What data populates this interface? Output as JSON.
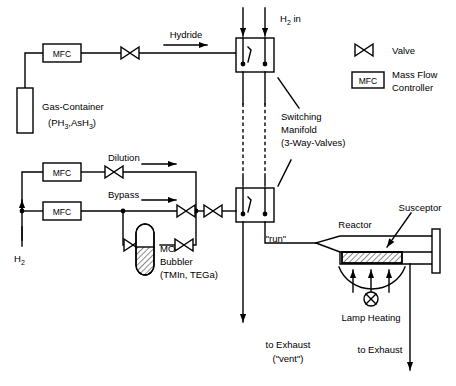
{
  "diagram": {
    "type": "process-flow-diagram",
    "stroke_color": "#000000",
    "background_color": "#ffffff"
  },
  "legend": {
    "items": [
      {
        "icon": "valve-icon",
        "label": "Valve"
      },
      {
        "icon": "mfc-box-icon",
        "box_text": "MFC",
        "label_line1": "Mass Flow",
        "label_line2": "Controller"
      }
    ]
  },
  "labels": {
    "h2_in": "H",
    "h2_in_sub": "2",
    "h2_in_rest": " in",
    "h2_in_full": "H₂ in",
    "hydride": "Hydride",
    "gas_container_line1": "Gas-Container",
    "gas_container_line2_a": "(PH",
    "gas_container_line2_sub1": "3",
    "gas_container_line2_b": ",AsH",
    "gas_container_line2_sub2": "3",
    "gas_container_line2_c": ")",
    "dilution": "Dilution",
    "bypass": "Bypass",
    "h2_inlet": "H",
    "h2_inlet_sub": "2",
    "mo_bubbler_line1": "MO-",
    "mo_bubbler_line2": "Bubbler",
    "mo_bubbler_line3": "(TMIn, TEGa)",
    "switching_line1": "Switching",
    "switching_line2": "Manifold",
    "switching_line3": "(3-Way-Valves)",
    "run": "\"run\"",
    "reactor": "Reactor",
    "susceptor": "Susceptor",
    "lamp_heating": "Lamp Heating",
    "to_exhaust_vent_line1": "to Exhaust",
    "to_exhaust_vent_line2": "(\"vent\")",
    "to_exhaust_reactor": "to Exhaust"
  },
  "components": {
    "mfc_boxes": [
      {
        "name": "mfc-hydride",
        "text": "MFC"
      },
      {
        "name": "mfc-dilution",
        "text": "MFC"
      },
      {
        "name": "mfc-bypass",
        "text": "MFC"
      },
      {
        "name": "mfc-legend",
        "text": "MFC"
      }
    ],
    "valves": [
      {
        "name": "valve-hydride"
      },
      {
        "name": "valve-dilution"
      },
      {
        "name": "valve-bypass"
      },
      {
        "name": "valve-bubbler-inlet"
      },
      {
        "name": "valve-bubbler-outlet"
      },
      {
        "name": "valve-mo-line"
      },
      {
        "name": "valve-legend"
      }
    ],
    "manifolds": [
      {
        "name": "switching-manifold-upper"
      },
      {
        "name": "switching-manifold-lower"
      }
    ],
    "gas_container": {
      "name": "gas-container"
    },
    "bubbler": {
      "name": "mo-bubbler"
    },
    "reactor": {
      "name": "reactor-tube"
    },
    "susceptor": {
      "name": "susceptor"
    },
    "lamp": {
      "name": "lamp-heating"
    }
  }
}
